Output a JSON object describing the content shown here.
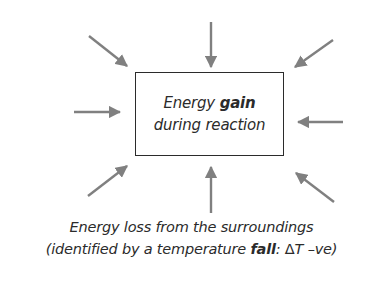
{
  "diagram": {
    "type": "energy-flow",
    "arrow_color": "#808080",
    "text_color": "#2b2b2b",
    "box": {
      "line1_prefix": "Energy ",
      "line1_bold": "gain",
      "line2": "during reaction"
    },
    "arrows": [
      {
        "name": "arrow-top-left",
        "direction": "inward"
      },
      {
        "name": "arrow-top",
        "direction": "inward"
      },
      {
        "name": "arrow-top-right",
        "direction": "inward"
      },
      {
        "name": "arrow-left",
        "direction": "inward"
      },
      {
        "name": "arrow-right",
        "direction": "inward"
      },
      {
        "name": "arrow-bottom-left",
        "direction": "inward"
      },
      {
        "name": "arrow-bottom",
        "direction": "inward"
      },
      {
        "name": "arrow-bottom-right",
        "direction": "inward"
      }
    ],
    "caption": {
      "line1": "Energy loss from the surroundings",
      "line2_prefix": "(identified by a temperature ",
      "line2_bold": "fall",
      "line2_colon": ": ",
      "line2_delta": "Δ",
      "line2_suffix": "T –ve)"
    }
  }
}
